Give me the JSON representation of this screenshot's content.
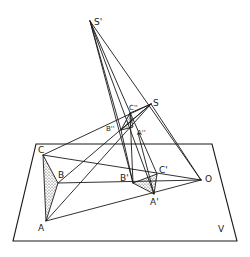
{
  "figure": {
    "plane_label": "V",
    "points": {
      "S_prime": {
        "label": "S'",
        "x": 90,
        "y": 21
      },
      "S": {
        "label": "S",
        "x": 151,
        "y": 104
      },
      "C_dprime": {
        "label": "C''",
        "x": 130,
        "y": 113
      },
      "B_dprime": {
        "label": "B''",
        "x": 121,
        "y": 130
      },
      "A_dprime": {
        "label": "A''",
        "x": 138,
        "y": 133
      },
      "C": {
        "label": "C",
        "x": 43,
        "y": 155
      },
      "B": {
        "label": "B",
        "x": 58,
        "y": 183
      },
      "A": {
        "label": "A",
        "x": 46,
        "y": 221
      },
      "B_prime": {
        "label": "B'",
        "x": 133,
        "y": 183
      },
      "C_prime": {
        "label": "C'",
        "x": 157,
        "y": 174
      },
      "A_prime": {
        "label": "A'",
        "x": 154,
        "y": 194
      },
      "O": {
        "label": "O",
        "x": 201,
        "y": 180
      }
    },
    "plane_corners": [
      [
        36,
        144
      ],
      [
        212,
        144
      ],
      [
        237,
        241
      ],
      [
        13,
        241
      ]
    ]
  }
}
